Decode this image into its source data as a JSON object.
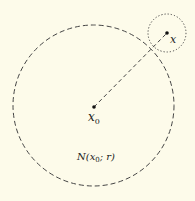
{
  "diagram": {
    "background": "#fdfbea",
    "stroke_color": "#333333",
    "big_circle": {
      "cx": 93.5,
      "cy": 105.5,
      "r": 80.5,
      "style": "dashed",
      "label": "N(x₀; r)"
    },
    "small_circle": {
      "cx": 167,
      "cy": 33,
      "r": 19,
      "style": "dotted"
    },
    "center_point": {
      "x": 94,
      "y": 107,
      "label": "x",
      "subscript": "0"
    },
    "outer_point": {
      "x": 167,
      "y": 33,
      "label": "x"
    },
    "connector": {
      "style": "dashed"
    }
  },
  "labels": {
    "x0_main": "x",
    "x0_sub": "0",
    "x_point": "x",
    "neighborhood_N": "N(",
    "neighborhood_x": "x",
    "neighborhood_sub": "0",
    "neighborhood_rest": "; r)"
  }
}
